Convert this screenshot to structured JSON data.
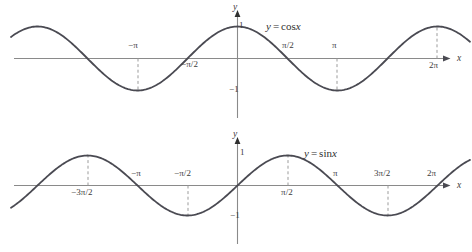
{
  "figure": {
    "background": "#ffffff",
    "curve_color": "#4a4a52",
    "axis_color": "#8a8a8a",
    "dash_color": "#9b9b9b",
    "text_color": "#3b3b3b"
  },
  "chart_data": [
    {
      "type": "line",
      "title": "y = cos x",
      "equation_lhs": "y",
      "equation_op": "=",
      "equation_rhs_fn": "cos",
      "equation_rhs_var": "x",
      "xlabel": "x",
      "ylabel": "y",
      "xlim": [
        -7.5,
        7.4
      ],
      "ylim": [
        -1.6,
        1.6
      ],
      "grid": false,
      "legend": "none",
      "x_tick_labels": [
        "−π",
        "−π/2",
        "π/2",
        "π",
        "2π"
      ],
      "x_tick_values": [
        -3.14159,
        -1.5708,
        1.5708,
        3.14159,
        6.28319
      ],
      "y_tick_labels": [
        "1",
        "−1"
      ],
      "y_tick_values": [
        1,
        -1
      ],
      "dashed_guides_x": [
        -3.14159,
        3.14159,
        6.28319
      ],
      "x": [
        -7.5,
        -7.0,
        -6.5,
        -6.0,
        -5.5,
        -5.0,
        -4.5,
        -4.0,
        -3.5,
        -3.0,
        -2.5,
        -2.0,
        -1.5,
        -1.0,
        -0.5,
        0.0,
        0.5,
        1.0,
        1.5,
        2.0,
        2.5,
        3.0,
        3.5,
        4.0,
        4.5,
        5.0,
        5.5,
        6.0,
        6.5,
        7.0,
        7.4
      ],
      "values": [
        0.347,
        0.754,
        0.977,
        0.96,
        0.709,
        0.284,
        -0.211,
        -0.654,
        -0.936,
        -0.99,
        -0.801,
        -0.416,
        0.071,
        0.54,
        0.878,
        1.0,
        0.878,
        0.54,
        0.071,
        -0.416,
        -0.801,
        -0.99,
        -0.936,
        -0.654,
        -0.211,
        0.284,
        0.709,
        0.96,
        0.977,
        0.754,
        0.452
      ]
    },
    {
      "type": "line",
      "title": "y = sin x",
      "equation_lhs": "y",
      "equation_op": "=",
      "equation_rhs_fn": "sin",
      "equation_rhs_var": "x",
      "xlabel": "x",
      "ylabel": "y",
      "xlim": [
        -7.5,
        7.4
      ],
      "ylim": [
        -1.6,
        1.6
      ],
      "grid": false,
      "legend": "none",
      "x_tick_labels": [
        "−3π/2",
        "−π",
        "−π/2",
        "π/2",
        "π",
        "3π/2",
        "2π"
      ],
      "x_tick_values": [
        -4.71239,
        -3.14159,
        -1.5708,
        1.5708,
        3.14159,
        4.71239,
        6.28319
      ],
      "y_tick_labels": [
        "1",
        "−1"
      ],
      "y_tick_values": [
        1,
        -1
      ],
      "dashed_guides_x": [
        -4.71239,
        -1.5708,
        1.5708,
        4.71239
      ],
      "x": [
        -7.5,
        -7.0,
        -6.5,
        -6.0,
        -5.5,
        -5.0,
        -4.5,
        -4.0,
        -3.5,
        -3.0,
        -2.5,
        -2.0,
        -1.5,
        -1.0,
        -0.5,
        0.0,
        0.5,
        1.0,
        1.5,
        2.0,
        2.5,
        3.0,
        3.5,
        4.0,
        4.5,
        5.0,
        5.5,
        6.0,
        6.5,
        7.0,
        7.4
      ],
      "values": [
        -0.938,
        -0.657,
        -0.215,
        0.279,
        0.706,
        0.959,
        0.978,
        0.757,
        0.351,
        -0.141,
        -0.599,
        -0.909,
        -0.997,
        -0.841,
        -0.479,
        0.0,
        0.479,
        0.841,
        0.997,
        0.909,
        0.599,
        0.141,
        -0.351,
        -0.757,
        -0.978,
        -0.959,
        -0.706,
        -0.279,
        0.215,
        0.657,
        0.872
      ]
    }
  ],
  "cos_panel": {
    "equation": {
      "lhs": "y",
      "op": "=",
      "fn": "cos",
      "var": "x"
    },
    "axis_x_label": "x",
    "axis_y_label": "y",
    "ticks": [
      {
        "text": "−π"
      },
      {
        "text": "−π/2"
      },
      {
        "text": "π/2"
      },
      {
        "text": "π"
      },
      {
        "text": "2π"
      },
      {
        "text": "1"
      },
      {
        "text": "−1"
      }
    ]
  },
  "sin_panel": {
    "equation": {
      "lhs": "y",
      "op": "=",
      "fn": "sin",
      "var": "x"
    },
    "axis_x_label": "x",
    "axis_y_label": "y",
    "ticks": [
      {
        "text": "−3π/2"
      },
      {
        "text": "−π"
      },
      {
        "text": "−π/2"
      },
      {
        "text": "π/2"
      },
      {
        "text": "π"
      },
      {
        "text": "3π/2"
      },
      {
        "text": "2π"
      },
      {
        "text": "1"
      },
      {
        "text": "−1"
      }
    ]
  }
}
